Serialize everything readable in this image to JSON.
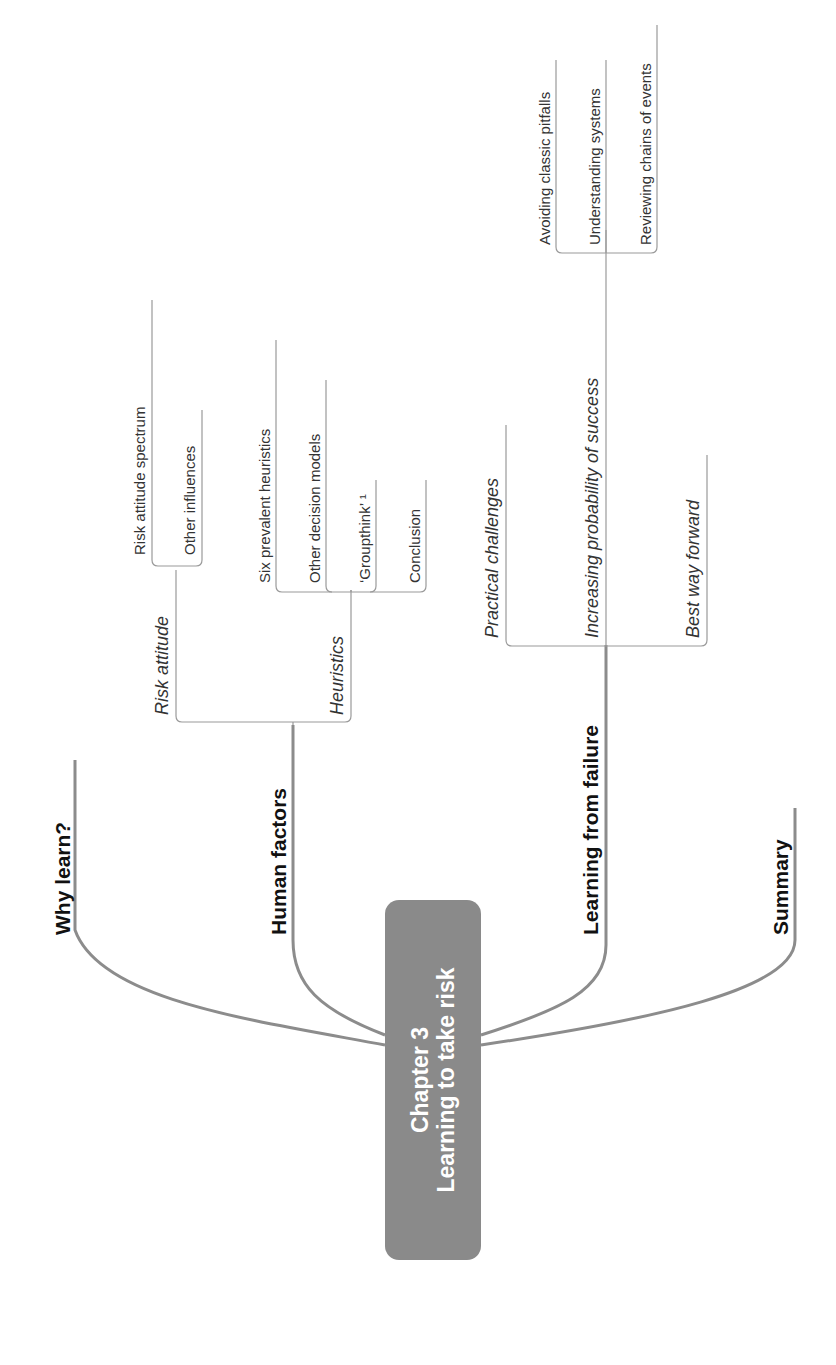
{
  "center": {
    "line1": "Chapter  3",
    "line2": "Learning to take risk",
    "color": "#8a8a8a"
  },
  "branches": [
    {
      "label": "Why learn?",
      "children": []
    },
    {
      "label": "Human factors",
      "children": [
        {
          "label": "Risk attitude",
          "children": [
            "Risk attitude spectrum",
            "Other influences"
          ]
        },
        {
          "label": "Heuristics",
          "children": [
            "Six prevalent heuristics",
            "Other decision models",
            "‘Groupthink’ ¹",
            "Conclusion"
          ]
        }
      ]
    },
    {
      "label": "Learning from failure",
      "children": [
        {
          "label": "Practical challenges",
          "children": []
        },
        {
          "label": "Increasing probability of success",
          "children": [
            "Avoiding classic pitfalls",
            "Understanding systems",
            "Reviewing chains of events"
          ]
        },
        {
          "label": "Best way forward",
          "children": []
        }
      ]
    },
    {
      "label": "Summary",
      "children": []
    }
  ],
  "colors": {
    "connector": "#8c8c8c",
    "thin_line": "#999999"
  }
}
